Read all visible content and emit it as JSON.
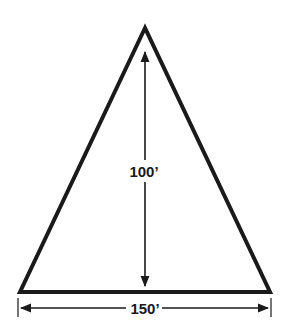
{
  "diagram": {
    "shape": "isosceles-triangle",
    "height_label": "100’",
    "base_label": "150’",
    "colors": {
      "stroke": "#1a1a1a",
      "background": "#ffffff"
    }
  }
}
